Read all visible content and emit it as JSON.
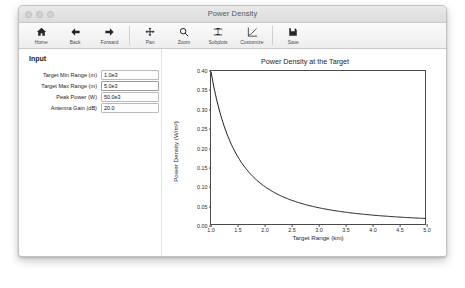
{
  "window": {
    "title": "Power Density",
    "traffic_lights": [
      "close-button",
      "minimize-button",
      "zoom-button"
    ]
  },
  "toolbar": {
    "items": [
      {
        "label": "Home",
        "icon": "home-icon"
      },
      {
        "label": "Back",
        "icon": "arrow-left-icon"
      },
      {
        "label": "Forward",
        "icon": "arrow-right-icon"
      },
      {
        "label": "Pan",
        "icon": "move-cross-icon"
      },
      {
        "label": "Zoom",
        "icon": "magnifier-icon"
      },
      {
        "label": "Subplots",
        "icon": "sliders-icon"
      },
      {
        "label": "Customize",
        "icon": "axes-curve-icon"
      },
      {
        "label": "Save",
        "icon": "floppy-disk-icon"
      }
    ]
  },
  "input_panel": {
    "heading": "Input",
    "fields": [
      {
        "label": "Target Min Range (m)",
        "value": "1.0e3",
        "focused": false
      },
      {
        "label": "Target Max Range (m)",
        "value": "5.0e3",
        "focused": true
      },
      {
        "label": "Peak Power (W)",
        "value": "50.0e3",
        "focused": false
      },
      {
        "label": "Antenna Gain (dB)",
        "value": "20.0",
        "focused": false
      }
    ]
  },
  "chart_data": {
    "type": "line",
    "title": "Power Density at the Target",
    "xlabel": "Target Range (km)",
    "ylabel": "Power Density (W/m²)",
    "xlim": [
      1.0,
      5.0
    ],
    "ylim": [
      0.0,
      0.4
    ],
    "xticks": [
      "1.0",
      "1.5",
      "2.0",
      "2.5",
      "3.0",
      "3.5",
      "4.0",
      "4.5",
      "5.0"
    ],
    "xtick_values": [
      1.0,
      1.5,
      2.0,
      2.5,
      3.0,
      3.5,
      4.0,
      4.5,
      5.0
    ],
    "yticks": [
      "0.00",
      "0.05",
      "0.10",
      "0.15",
      "0.20",
      "0.25",
      "0.30",
      "0.35",
      "0.40"
    ],
    "ytick_values": [
      0.0,
      0.05,
      0.1,
      0.15,
      0.2,
      0.25,
      0.3,
      0.35,
      0.4
    ],
    "grid": false,
    "legend": null,
    "line_color": "#1a1a1a",
    "series": [
      {
        "name": "Power Density",
        "x": [
          1.0,
          1.1,
          1.2,
          1.3,
          1.4,
          1.5,
          1.6,
          1.7,
          1.8,
          1.9,
          2.0,
          2.2,
          2.4,
          2.6,
          2.8,
          3.0,
          3.2,
          3.4,
          3.6,
          3.8,
          4.0,
          4.25,
          4.5,
          4.75,
          5.0
        ],
        "values": [
          0.398,
          0.329,
          0.276,
          0.235,
          0.203,
          0.177,
          0.155,
          0.138,
          0.123,
          0.11,
          0.099,
          0.082,
          0.069,
          0.059,
          0.051,
          0.044,
          0.039,
          0.034,
          0.031,
          0.028,
          0.025,
          0.022,
          0.02,
          0.018,
          0.016
        ]
      }
    ]
  }
}
